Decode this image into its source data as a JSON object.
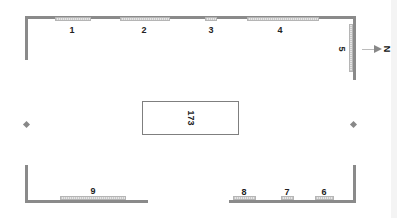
{
  "diagram": {
    "type": "floor-plan",
    "colors": {
      "wall": "#8a8a8a",
      "window": "#d6d6d6",
      "text": "#222222"
    },
    "compass": {
      "label": "N",
      "direction": "right"
    },
    "center_object": {
      "label": "173"
    },
    "windows": [
      {
        "id": "1",
        "label": "1",
        "wall": "top"
      },
      {
        "id": "2",
        "label": "2",
        "wall": "top"
      },
      {
        "id": "3",
        "label": "3",
        "wall": "top"
      },
      {
        "id": "4",
        "label": "4",
        "wall": "top"
      },
      {
        "id": "5",
        "label": "5",
        "wall": "right"
      },
      {
        "id": "6",
        "label": "6",
        "wall": "bottom"
      },
      {
        "id": "7",
        "label": "7",
        "wall": "bottom"
      },
      {
        "id": "8",
        "label": "8",
        "wall": "bottom"
      },
      {
        "id": "9",
        "label": "9",
        "wall": "bottom"
      }
    ]
  }
}
